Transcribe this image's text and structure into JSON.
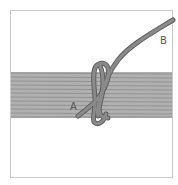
{
  "diagram": {
    "type": "knot-illustration",
    "labels": {
      "a": "A",
      "b": "B"
    },
    "colors": {
      "frame": "#c8c8c8",
      "band_fill": "#a9a9a9",
      "band_lines": "#8c8c8c",
      "rope": "#7a7a7a",
      "rope_outline": "#5e5e5e",
      "label": "#555555"
    }
  }
}
